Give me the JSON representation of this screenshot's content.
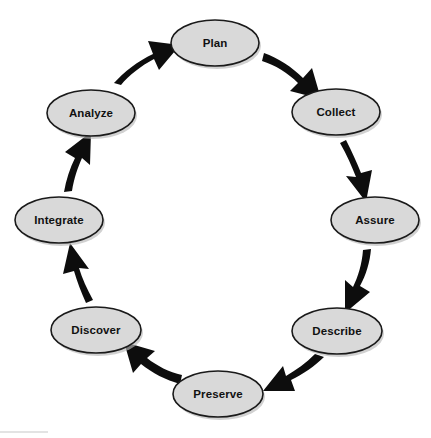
{
  "diagram": {
    "type": "circular-process-cycle",
    "direction": "clockwise",
    "node_fill_color": "#d9d9d9",
    "node_border_color": "#1a1a1a",
    "arrow_color": "#0d0d0d",
    "background_color": "#ffffff",
    "nodes": [
      {
        "id": "plan",
        "label": "Plan",
        "cx": 215,
        "cy": 43,
        "rx": 44,
        "ry": 23
      },
      {
        "id": "collect",
        "label": "Collect",
        "cx": 336,
        "cy": 112,
        "rx": 44,
        "ry": 23
      },
      {
        "id": "assure",
        "label": "Assure",
        "cx": 375,
        "cy": 220,
        "rx": 44,
        "ry": 23
      },
      {
        "id": "describe",
        "label": "Describe",
        "cx": 337,
        "cy": 331,
        "rx": 45,
        "ry": 23
      },
      {
        "id": "preserve",
        "label": "Preserve",
        "cx": 218,
        "cy": 394,
        "rx": 45,
        "ry": 23
      },
      {
        "id": "discover",
        "label": "Discover",
        "cx": 96,
        "cy": 330,
        "rx": 45,
        "ry": 23
      },
      {
        "id": "integrate",
        "label": "Integrate",
        "cx": 59,
        "cy": 220,
        "rx": 44,
        "ry": 23
      },
      {
        "id": "analyze",
        "label": "Analyze",
        "cx": 91,
        "cy": 113,
        "rx": 44,
        "ry": 23
      }
    ],
    "edges": [
      {
        "id": "plan-to-collect",
        "from": "Plan",
        "to": "Collect"
      },
      {
        "id": "collect-to-assure",
        "from": "Collect",
        "to": "Assure"
      },
      {
        "id": "assure-to-describe",
        "from": "Assure",
        "to": "Describe"
      },
      {
        "id": "describe-to-preserve",
        "from": "Describe",
        "to": "Preserve"
      },
      {
        "id": "preserve-to-discover",
        "from": "Preserve",
        "to": "Discover"
      },
      {
        "id": "discover-to-integrate",
        "from": "Discover",
        "to": "Integrate"
      },
      {
        "id": "integrate-to-analyze",
        "from": "Integrate",
        "to": "Analyze"
      },
      {
        "id": "analyze-to-plan",
        "from": "Analyze",
        "to": "Plan"
      }
    ]
  }
}
